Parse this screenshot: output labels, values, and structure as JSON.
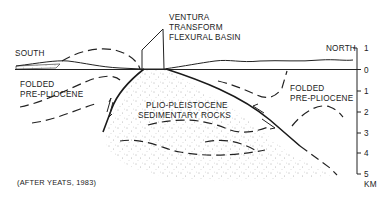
{
  "diagram": {
    "type": "geologic cross-section",
    "labels": {
      "south": "SOUTH",
      "north": "NORTH",
      "basin_line1": "VENTURA",
      "basin_line2": "TRANSFORM",
      "basin_line3": "FLEXURAL BASIN",
      "left_unit_line1": "FOLDED",
      "left_unit_line2": "PRE-PLIOCENE",
      "right_unit_line1": "FOLDED",
      "right_unit_line2": "PRE-PLIOCENE",
      "center_unit_line1": "PLIO-PLEISTOCENE",
      "center_unit_line2": "SEDIMENTARY ROCKS",
      "citation": "(AFTER YEATS, 1983)"
    },
    "scale": {
      "unit": "KM",
      "ticks": [
        "1",
        "0",
        "1",
        "2",
        "3",
        "4",
        "5"
      ]
    },
    "colors": {
      "ink": "#222222",
      "background": "#ffffff",
      "stipple": "#555555"
    }
  }
}
